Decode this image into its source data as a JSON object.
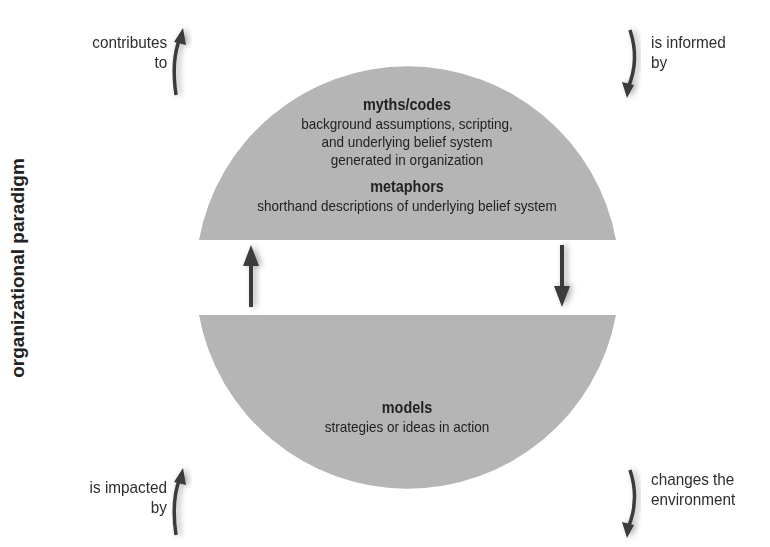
{
  "caption_top": {
    "text": "(cut off caption — only descenders visible)"
  },
  "vertical_title": "organizational paradigm",
  "labels": {
    "top_left": [
      "contributes",
      "to"
    ],
    "top_right": [
      "is informed",
      "by"
    ],
    "bottom_left": [
      "is impacted",
      "by"
    ],
    "bottom_right": [
      "changes the",
      "environment"
    ]
  },
  "top_section": {
    "heading1": "myths/codes",
    "desc1": [
      "background assumptions, scripting,",
      "and underlying belief system",
      "generated in organization"
    ],
    "heading2": "metaphors",
    "desc2": [
      "shorthand descriptions of underlying belief system"
    ]
  },
  "bottom_section": {
    "heading": "models",
    "desc": "strategies or ideas in action"
  },
  "colors": {
    "shape_fill": "#b5b5b5",
    "arrow": "#3a3a3a",
    "text": "#222222"
  }
}
